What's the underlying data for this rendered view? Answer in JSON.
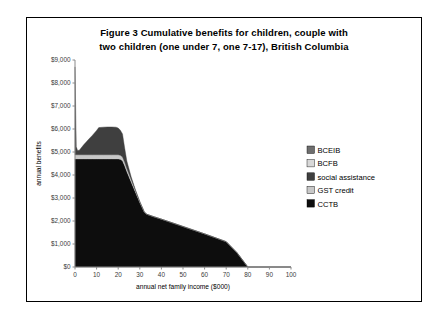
{
  "figure": {
    "title_line1": "Figure 3   Cumulative benefits for children, couple with",
    "title_line2": "two children (one under 7, one 7-17), British Columbia"
  },
  "chart_data": {
    "type": "area",
    "stacked": true,
    "title": "Figure 3   Cumulative benefits for children, couple with two children (one under 7, one 7-17), British Columbia",
    "xlabel": "annual net family income ($000)",
    "ylabel": "annual benefits",
    "xlim": [
      0,
      100
    ],
    "ylim": [
      0,
      9000
    ],
    "xticks": [
      0,
      10,
      20,
      30,
      40,
      50,
      60,
      70,
      80,
      90,
      100
    ],
    "xtick_labels": [
      "0",
      "10",
      "20",
      "30",
      "40",
      "50",
      "60",
      "70",
      "80",
      "90",
      "100"
    ],
    "yticks": [
      0,
      1000,
      2000,
      3000,
      4000,
      5000,
      6000,
      7000,
      8000,
      9000
    ],
    "ytick_labels": [
      "$0",
      "$1,000",
      "$2,000",
      "$3,000",
      "$4,000",
      "$5,000",
      "$6,000",
      "$7,000",
      "$8,000",
      "$9,000"
    ],
    "grid": false,
    "legend_position": "right",
    "x": [
      0,
      0.6,
      1.2,
      2,
      4,
      6,
      8,
      10,
      11,
      13,
      15,
      17,
      19,
      20,
      21,
      22,
      23,
      24,
      26,
      28,
      30,
      32,
      33,
      36,
      40,
      45,
      50,
      55,
      60,
      65,
      70,
      75,
      80,
      85,
      90,
      95,
      100
    ],
    "series": [
      {
        "name": "CCTB",
        "color": "#0d0d0d",
        "values": [
          4700,
          4700,
          4700,
          4700,
          4700,
          4700,
          4700,
          4700,
          4700,
          4700,
          4700,
          4700,
          4700,
          4700,
          4680,
          4620,
          4400,
          4150,
          3700,
          3250,
          2800,
          2400,
          2300,
          2200,
          2080,
          1920,
          1760,
          1600,
          1440,
          1270,
          1100,
          620,
          0,
          0,
          0,
          0,
          0
        ]
      },
      {
        "name": "GST credit",
        "color": "#c8c8c8",
        "values": [
          180,
          180,
          180,
          180,
          180,
          180,
          180,
          180,
          180,
          180,
          180,
          180,
          180,
          180,
          175,
          165,
          150,
          130,
          100,
          70,
          40,
          10,
          0,
          0,
          0,
          0,
          0,
          0,
          0,
          0,
          0,
          0,
          0,
          0,
          0,
          0,
          0
        ]
      },
      {
        "name": "social assistance",
        "color": "#3f3f3f",
        "values": [
          3820,
          350,
          180,
          200,
          430,
          640,
          840,
          1060,
          1180,
          1200,
          1210,
          1210,
          1200,
          1160,
          1090,
          1000,
          620,
          330,
          120,
          30,
          0,
          0,
          0,
          0,
          0,
          0,
          0,
          0,
          0,
          0,
          0,
          0,
          0,
          0,
          0,
          0,
          0
        ]
      },
      {
        "name": "BCFB",
        "color": "#d8d8d8",
        "values": [
          0,
          0,
          0,
          0,
          0,
          0,
          0,
          0,
          0,
          0,
          0,
          0,
          0,
          0,
          0,
          0,
          0,
          0,
          0,
          0,
          0,
          0,
          0,
          0,
          0,
          0,
          0,
          0,
          0,
          0,
          0,
          0,
          0,
          0,
          0,
          0,
          0
        ]
      },
      {
        "name": "BCEIB",
        "color": "#6e6e6e",
        "values": [
          0,
          0,
          0,
          0,
          0,
          0,
          0,
          0,
          0,
          0,
          0,
          0,
          0,
          0,
          0,
          0,
          0,
          0,
          0,
          0,
          0,
          0,
          0,
          0,
          0,
          0,
          0,
          0,
          0,
          0,
          0,
          0,
          0,
          0,
          0,
          0,
          0
        ]
      }
    ],
    "legend": [
      {
        "label": "BCEIB",
        "color": "#6e6e6e"
      },
      {
        "label": "BCFB",
        "color": "#d8d8d8"
      },
      {
        "label": "social assistance",
        "color": "#3f3f3f"
      },
      {
        "label": "GST credit",
        "color": "#c8c8c8"
      },
      {
        "label": "CCTB",
        "color": "#0d0d0d"
      }
    ]
  }
}
